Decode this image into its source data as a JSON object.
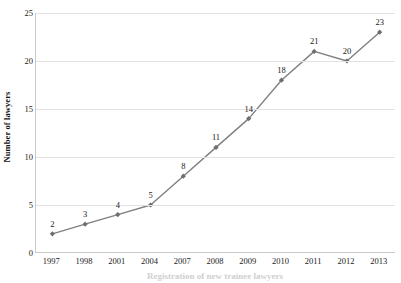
{
  "chart_data": {
    "type": "line",
    "title": "",
    "xlabel": "Registration of new trainee lawyers",
    "ylabel": "Number of lawyers",
    "categories": [
      "1997",
      "1998",
      "2001",
      "2004",
      "2007",
      "2008",
      "2009",
      "2010",
      "2011",
      "2012",
      "2013"
    ],
    "values": [
      2,
      3,
      4,
      5,
      8,
      11,
      14,
      18,
      21,
      20,
      23
    ],
    "data_labels": [
      "2",
      "3",
      "4",
      "5",
      "8",
      "11",
      "14",
      "18",
      "21",
      "20",
      "23"
    ],
    "ylim": [
      0,
      25
    ],
    "y_ticks": [
      "0",
      "5",
      "10",
      "15",
      "20",
      "25"
    ],
    "y_tick_values": [
      0,
      5,
      10,
      15,
      20,
      25
    ],
    "grid": "horizontal",
    "legend": "none",
    "series": [
      {
        "name": "Number of lawyers",
        "values": [
          2,
          3,
          4,
          5,
          8,
          11,
          14,
          18,
          21,
          20,
          23
        ],
        "color": "#808080",
        "marker": "diamond"
      }
    ],
    "colors": {
      "line": "#808080",
      "marker": "#6e6e6e",
      "gridline": "#e2e2e2",
      "axis": "#c8c8c8",
      "text": "#1a1a1a",
      "background": "#ffffff"
    }
  }
}
